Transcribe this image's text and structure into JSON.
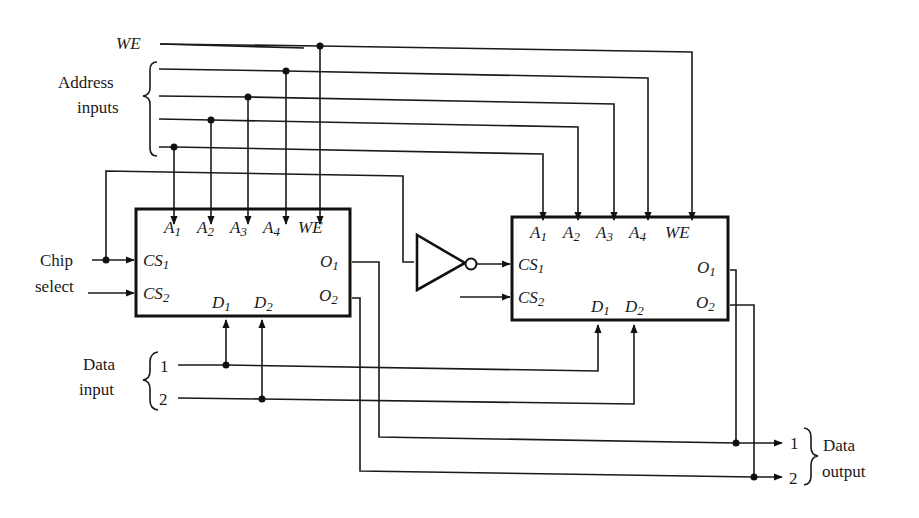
{
  "diagram": {
    "labels": {
      "we": "WE",
      "address_line1": "Address",
      "address_line2": "inputs",
      "chip_select_line1": "Chip",
      "chip_select_line2": "select",
      "data_input_line1": "Data",
      "data_input_line2": "input",
      "data_output_line1": "Data",
      "data_output_line2": "output",
      "data_in_1": "1",
      "data_in_2": "2",
      "data_out_1": "1",
      "data_out_2": "2"
    },
    "chips": [
      {
        "name": "chip-1",
        "pins": {
          "a": "A",
          "a1": "1",
          "a2": "2",
          "a3": "3",
          "a4": "4",
          "we": "WE",
          "cs": "CS",
          "cs1": "1",
          "cs2": "2",
          "d": "D",
          "d1": "1",
          "d2": "2",
          "o": "O",
          "o1": "1",
          "o2": "2"
        }
      },
      {
        "name": "chip-2",
        "pins": {
          "a": "A",
          "a1": "1",
          "a2": "2",
          "a3": "3",
          "a4": "4",
          "we": "WE",
          "cs": "CS",
          "cs1": "1",
          "cs2": "2",
          "d": "D",
          "d1": "1",
          "d2": "2",
          "o": "O",
          "o1": "1",
          "o2": "2"
        }
      }
    ],
    "gates": [
      {
        "type": "inverter",
        "input": "chip select",
        "output": "chip-2 CS1"
      }
    ],
    "colors": {
      "ink": "#1a1a1a",
      "background": "#ffffff"
    }
  }
}
